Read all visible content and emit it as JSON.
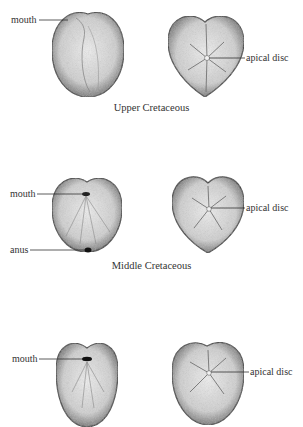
{
  "figure": {
    "rows": [
      {
        "caption": "Upper Cretaceous",
        "oral_view": {
          "labels": {
            "mouth": "mouth"
          }
        },
        "aboral_view": {
          "labels": {
            "apical_disc": "apical disc"
          }
        }
      },
      {
        "caption": "Middle Cretaceous",
        "oral_view": {
          "labels": {
            "mouth": "mouth",
            "anus": "anus"
          }
        },
        "aboral_view": {
          "labels": {
            "apical_disc": "apical disc"
          }
        }
      },
      {
        "caption": "",
        "oral_view": {
          "labels": {
            "mouth": "mouth"
          }
        },
        "aboral_view": {
          "labels": {
            "apical_disc": "apical disc"
          }
        }
      }
    ],
    "colors": {
      "ink": "#2a2a2a",
      "stipple_light": "#d8d8d8",
      "stipple_dark": "#6a6a6a",
      "background": "#ffffff"
    }
  }
}
